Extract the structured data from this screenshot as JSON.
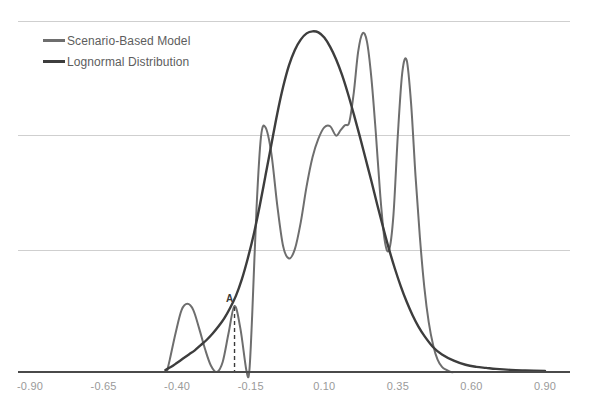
{
  "chart_data": {
    "type": "line",
    "title": "",
    "xlabel": "",
    "ylabel": "",
    "grid": true,
    "gridlines_y": [
      3,
      2,
      1
    ],
    "legend_position": "top-left",
    "xlim": [
      -0.9,
      0.9
    ],
    "ylim": [
      0,
      3.4
    ],
    "xticks": [
      -0.9,
      -0.65,
      -0.4,
      -0.15,
      0.1,
      0.35,
      0.6,
      0.9
    ],
    "xtick_labels": [
      "-0.90",
      "-0.65",
      "-0.40",
      "-0.15",
      "0.10",
      "0.35",
      "0.60",
      "0.90"
    ],
    "annotations": [
      {
        "label": "A",
        "x": -0.205,
        "y": 0.63,
        "marker": "dashed-vertical"
      }
    ],
    "series": [
      {
        "name": "Scenario-Based Model",
        "color": "#6e6e6e",
        "width": 2.0,
        "x": [
          -0.435,
          -0.425,
          -0.405,
          -0.385,
          -0.365,
          -0.345,
          -0.325,
          -0.305,
          -0.285,
          -0.265,
          -0.245,
          -0.225,
          -0.205,
          -0.185,
          -0.165,
          -0.155,
          -0.145,
          -0.13,
          -0.115,
          -0.1,
          -0.08,
          -0.06,
          -0.04,
          -0.02,
          0.0,
          0.02,
          0.04,
          0.06,
          0.08,
          0.1,
          0.12,
          0.14,
          0.155,
          0.17,
          0.185,
          0.2,
          0.215,
          0.23,
          0.245,
          0.26,
          0.275,
          0.29,
          0.305,
          0.32,
          0.335,
          0.35,
          0.365,
          0.38,
          0.395,
          0.41,
          0.425,
          0.44,
          0.455,
          0.47,
          0.485,
          0.5,
          0.515,
          0.53,
          0.545,
          0.56,
          0.58,
          0.6
        ],
        "y": [
          0.0,
          0.12,
          0.38,
          0.6,
          0.66,
          0.6,
          0.42,
          0.22,
          0.06,
          0.0,
          0.1,
          0.38,
          0.64,
          0.42,
          0.02,
          0.0,
          0.55,
          1.6,
          2.28,
          2.37,
          2.12,
          1.62,
          1.22,
          1.1,
          1.19,
          1.45,
          1.8,
          2.08,
          2.26,
          2.37,
          2.38,
          2.29,
          2.34,
          2.39,
          2.42,
          2.7,
          3.1,
          3.28,
          3.2,
          2.85,
          2.32,
          1.72,
          1.28,
          1.18,
          1.52,
          2.3,
          2.9,
          3.02,
          2.6,
          1.9,
          1.3,
          0.82,
          0.48,
          0.26,
          0.12,
          0.05,
          0.02,
          0.0,
          0.0,
          0.0,
          0.0,
          0.0
        ]
      },
      {
        "name": "Lognormal Distribution",
        "color": "#3d3d3d",
        "width": 2.4,
        "x": [
          -0.44,
          -0.42,
          -0.4,
          -0.38,
          -0.36,
          -0.34,
          -0.32,
          -0.3,
          -0.28,
          -0.26,
          -0.24,
          -0.22,
          -0.2,
          -0.18,
          -0.16,
          -0.14,
          -0.12,
          -0.1,
          -0.08,
          -0.06,
          -0.04,
          -0.02,
          0.0,
          0.02,
          0.04,
          0.06,
          0.08,
          0.1,
          0.12,
          0.14,
          0.16,
          0.18,
          0.2,
          0.22,
          0.24,
          0.26,
          0.28,
          0.3,
          0.32,
          0.34,
          0.36,
          0.38,
          0.4,
          0.42,
          0.44,
          0.47,
          0.5,
          0.54,
          0.58,
          0.62,
          0.66,
          0.7,
          0.76,
          0.82,
          0.9
        ],
        "y": [
          0.02,
          0.05,
          0.09,
          0.13,
          0.17,
          0.21,
          0.26,
          0.31,
          0.37,
          0.44,
          0.52,
          0.62,
          0.74,
          0.9,
          1.1,
          1.33,
          1.6,
          1.9,
          2.2,
          2.5,
          2.76,
          2.97,
          3.12,
          3.22,
          3.28,
          3.3,
          3.29,
          3.24,
          3.15,
          3.03,
          2.88,
          2.7,
          2.5,
          2.29,
          2.07,
          1.85,
          1.62,
          1.4,
          1.19,
          1.0,
          0.83,
          0.68,
          0.55,
          0.44,
          0.35,
          0.24,
          0.17,
          0.11,
          0.07,
          0.05,
          0.04,
          0.03,
          0.02,
          0.015,
          0.01
        ]
      }
    ]
  },
  "legend": {
    "entries": [
      {
        "label": "Scenario-Based Model",
        "color": "#6e6e6e"
      },
      {
        "label": "Lognormal Distribution",
        "color": "#3d3d3d"
      }
    ]
  },
  "axis": {
    "baseline_color": "#4a4a4a",
    "gridline_color": "#cfcfcf",
    "tick_label_color": "#9a9a9a"
  }
}
